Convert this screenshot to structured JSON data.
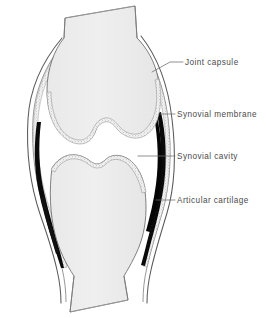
{
  "figure": {
    "background_color": "#ffffff",
    "bone_fill_color": "#eeeeee",
    "bone_fill_color_dark": "#e4e4e4",
    "outline_color": "#555555",
    "capsule_line_color": "#3a3a3a",
    "cavity_color": "#000000",
    "membrane_stipple_color": "#8a8a8a",
    "cartilage_color": "#9a9a9a",
    "leader_line_color": "#6b6b6b",
    "label_text_color": "#4a4a4a"
  },
  "labels": [
    {
      "id": "joint-capsule",
      "text": "Joint capsule",
      "leader": {
        "x1": 151,
        "y1": 71,
        "x2": 170,
        "y2": 62,
        "x3": 183,
        "y3": 62
      }
    },
    {
      "id": "synovial-membrane",
      "text": "Synovial membrane",
      "leader": {
        "x1": 161,
        "y1": 114,
        "x2": 175,
        "y2": 114,
        "x3": 175,
        "y3": 114
      }
    },
    {
      "id": "synovial-cavity",
      "text": "Synovial cavity",
      "leader": {
        "x1": 139,
        "y1": 156,
        "x2": 175,
        "y2": 156,
        "x3": 175,
        "y3": 156
      }
    },
    {
      "id": "articular-cartilage",
      "text": "Articular cartilage",
      "leader": {
        "x1": 157,
        "y1": 200,
        "x2": 175,
        "y2": 200,
        "x3": 175,
        "y3": 200
      }
    }
  ],
  "anatomy": {
    "femur_shaft": "upper bone shaft, diagonally cut at top",
    "femoral_condyles": "rounded lobes with central intercondylar notch",
    "tibial_plateau": "lower bone with wavy articular surface",
    "tibia_shaft": "lower bone shaft, diagonally cut at bottom",
    "joint_capsule": "outer fibrous envelope surrounding the joint",
    "synovial_membrane": "stippled lining inside the capsule",
    "synovial_cavity": "black space between capsule and bone, and joint gap",
    "articular_cartilage": "stippled layer capping the bone ends"
  }
}
